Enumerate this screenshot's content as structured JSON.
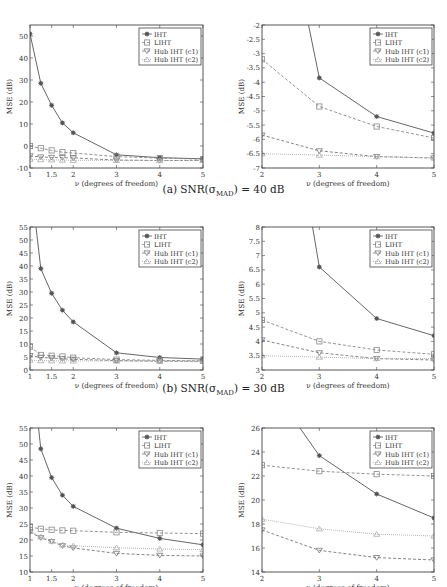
{
  "legend_labels": [
    "IHT",
    "LIHT",
    "Hub IHT (c1)",
    "Hub IHT (c2)"
  ],
  "captions": [
    {
      "prefix": "(a) SNR(σ",
      "sub": "MAD",
      "suffix": ") = 40 dB"
    },
    {
      "prefix": "(b) SNR(σ",
      "sub": "MAD",
      "suffix": ") = 30 dB"
    }
  ],
  "chart_data": [
    {
      "id": "a-left",
      "type": "line",
      "title": "",
      "xlabel": "ν (degrees of freedom)",
      "ylabel": "MSE (dB)",
      "xlim": [
        1,
        5
      ],
      "ylim": [
        -10,
        55
      ],
      "xticks": [
        1,
        1.5,
        2,
        3,
        4,
        5
      ],
      "yticks": [
        -10,
        0,
        10,
        20,
        30,
        40,
        50
      ],
      "ytick_labels": [
        "-10",
        "0",
        "10",
        "20",
        "30",
        "40",
        "50"
      ],
      "grid": false,
      "legend_position": "upper right",
      "x": [
        1,
        1.25,
        1.5,
        1.75,
        2,
        3,
        4,
        5
      ],
      "series": [
        {
          "name": "IHT",
          "values": [
            51,
            28.5,
            18.5,
            10.5,
            6,
            -4,
            -5.3,
            -5.8
          ]
        },
        {
          "name": "LIHT",
          "values": [
            0,
            -1,
            -2,
            -2.8,
            -3.2,
            -4.8,
            -5.5,
            -6
          ]
        },
        {
          "name": "Hub IHT (c1)",
          "values": [
            -4.5,
            -5,
            -5.2,
            -5.3,
            -5.4,
            -6.4,
            -6.6,
            -6.6
          ]
        },
        {
          "name": "Hub IHT (c2)",
          "values": [
            -6,
            -6.2,
            -6.3,
            -6.4,
            -6.5,
            -6.5,
            -6.6,
            -6.6
          ]
        }
      ]
    },
    {
      "id": "a-right",
      "type": "line",
      "title": "",
      "xlabel": "ν (degrees of freedom)",
      "ylabel": "MSE (dB)",
      "xlim": [
        2,
        5
      ],
      "ylim": [
        -7,
        -2
      ],
      "xticks": [
        2,
        3,
        4,
        5
      ],
      "yticks": [
        -7,
        -6.5,
        -6,
        -5.5,
        -5,
        -4.5,
        -4,
        -3.5,
        -3,
        -2.5,
        -2
      ],
      "ytick_labels": [
        "-7",
        "-6.5",
        "-6",
        "-5.5",
        "-5",
        "-4.5",
        "-4",
        "-3.5",
        "-3",
        "-2.5",
        "-2"
      ],
      "grid": false,
      "legend_position": "upper right",
      "x": [
        2,
        3,
        4,
        5
      ],
      "series": [
        {
          "name": "IHT",
          "values": [
            6,
            -3.85,
            -5.2,
            -5.78
          ]
        },
        {
          "name": "LIHT",
          "values": [
            -3.2,
            -4.85,
            -5.55,
            -5.95
          ]
        },
        {
          "name": "Hub IHT (c1)",
          "values": [
            -5.85,
            -6.4,
            -6.6,
            -6.65
          ]
        },
        {
          "name": "Hub IHT (c2)",
          "values": [
            -6.5,
            -6.55,
            -6.6,
            -6.65
          ]
        }
      ]
    },
    {
      "id": "b-left",
      "type": "line",
      "title": "",
      "xlabel": "ν (degrees of freedom)",
      "ylabel": "MSE (dB)",
      "xlim": [
        1,
        5
      ],
      "ylim": [
        0,
        55
      ],
      "xticks": [
        1,
        1.5,
        2,
        3,
        4,
        5
      ],
      "yticks": [
        0,
        5,
        10,
        15,
        20,
        25,
        30,
        35,
        40,
        45,
        50,
        55
      ],
      "ytick_labels": [
        "0",
        "5",
        "10",
        "15",
        "20",
        "25",
        "30",
        "35",
        "40",
        "45",
        "50",
        "55"
      ],
      "grid": false,
      "legend_position": "upper right",
      "x": [
        1,
        1.25,
        1.5,
        1.75,
        2,
        3,
        4,
        5
      ],
      "series": [
        {
          "name": "IHT",
          "values": [
            75,
            39,
            29.5,
            23,
            18.5,
            6.6,
            4.8,
            4.2
          ]
        },
        {
          "name": "LIHT",
          "values": [
            9,
            5.8,
            5.5,
            5.2,
            4.75,
            4.0,
            3.7,
            3.5
          ]
        },
        {
          "name": "Hub IHT (c1)",
          "values": [
            5.5,
            4.8,
            4.6,
            4.3,
            4.1,
            3.6,
            3.4,
            3.35
          ]
        },
        {
          "name": "Hub IHT (c2)",
          "values": [
            3.8,
            3.6,
            3.55,
            3.5,
            3.5,
            3.45,
            3.4,
            3.4
          ]
        }
      ]
    },
    {
      "id": "b-right",
      "type": "line",
      "title": "",
      "xlabel": "ν (degrees of freedom)",
      "ylabel": "MSE (dB)",
      "xlim": [
        2,
        5
      ],
      "ylim": [
        3,
        8
      ],
      "xticks": [
        2,
        3,
        4,
        5
      ],
      "yticks": [
        3,
        3.5,
        4,
        4.5,
        5,
        5.5,
        6,
        6.5,
        7,
        7.5,
        8
      ],
      "ytick_labels": [
        "3",
        "3.5",
        "4",
        "4.5",
        "5",
        "5.5",
        "6",
        "6.5",
        "7",
        "7.5",
        "8"
      ],
      "grid": false,
      "legend_position": "upper right",
      "x": [
        2,
        3,
        4,
        5
      ],
      "series": [
        {
          "name": "IHT",
          "values": [
            18.5,
            6.6,
            4.8,
            4.2
          ]
        },
        {
          "name": "LIHT",
          "values": [
            4.75,
            4.0,
            3.7,
            3.55
          ]
        },
        {
          "name": "Hub IHT (c1)",
          "values": [
            4.05,
            3.6,
            3.4,
            3.35
          ]
        },
        {
          "name": "Hub IHT (c2)",
          "values": [
            3.5,
            3.45,
            3.4,
            3.4
          ]
        }
      ]
    },
    {
      "id": "c-left",
      "type": "line",
      "title": "",
      "xlabel": "ν (degrees of freedom)",
      "ylabel": "MSE (dB)",
      "xlim": [
        1,
        5
      ],
      "ylim": [
        10,
        55
      ],
      "xticks": [
        1,
        1.5,
        2,
        3,
        4,
        5
      ],
      "yticks": [
        10,
        15,
        20,
        25,
        30,
        35,
        40,
        45,
        50,
        55
      ],
      "ytick_labels": [
        "10",
        "15",
        "20",
        "25",
        "30",
        "35",
        "40",
        "45",
        "50",
        "55"
      ],
      "grid": false,
      "legend_position": "upper right",
      "x": [
        1,
        1.25,
        1.5,
        1.75,
        2,
        3,
        4,
        5
      ],
      "series": [
        {
          "name": "IHT",
          "values": [
            80,
            48.5,
            39.5,
            34,
            30.5,
            23.7,
            20.5,
            18.5
          ]
        },
        {
          "name": "LIHT",
          "values": [
            24,
            23.5,
            23.2,
            23,
            22.9,
            22.4,
            22.2,
            22
          ]
        },
        {
          "name": "Hub IHT (c1)",
          "values": [
            22.5,
            20.7,
            19.5,
            18.2,
            17.5,
            15.8,
            15.2,
            15
          ]
        },
        {
          "name": "Hub IHT (c2)",
          "values": [
            22.8,
            21,
            19.7,
            18.5,
            18.2,
            17.6,
            17.2,
            17
          ]
        }
      ]
    },
    {
      "id": "c-right",
      "type": "line",
      "title": "",
      "xlabel": "ν (degrees of freedom)",
      "ylabel": "MSE (dB)",
      "xlim": [
        2,
        5
      ],
      "ylim": [
        14,
        26
      ],
      "xticks": [
        2,
        3,
        4,
        5
      ],
      "yticks": [
        14,
        16,
        18,
        20,
        22,
        24,
        26
      ],
      "ytick_labels": [
        "14",
        "16",
        "18",
        "20",
        "22",
        "24",
        "26"
      ],
      "grid": false,
      "legend_position": "upper right",
      "x": [
        2,
        3,
        4,
        5
      ],
      "series": [
        {
          "name": "IHT",
          "values": [
            30.5,
            23.7,
            20.5,
            18.5
          ]
        },
        {
          "name": "LIHT",
          "values": [
            22.9,
            22.4,
            22.15,
            22.0
          ]
        },
        {
          "name": "Hub IHT (c1)",
          "values": [
            17.5,
            15.8,
            15.2,
            15.0
          ]
        },
        {
          "name": "Hub IHT (c2)",
          "values": [
            18.4,
            17.6,
            17.15,
            17.0
          ]
        }
      ]
    }
  ],
  "series_styles": [
    {
      "name": "IHT",
      "color": "#555555",
      "dash": "",
      "marker": "star"
    },
    {
      "name": "LIHT",
      "color": "#888888",
      "dash": "3,2",
      "marker": "square"
    },
    {
      "name": "Hub IHT (c1)",
      "color": "#777777",
      "dash": "3,2",
      "marker": "tri-down"
    },
    {
      "name": "Hub IHT (c2)",
      "color": "#aaaaaa",
      "dash": "1,1",
      "marker": "tri-up"
    }
  ]
}
